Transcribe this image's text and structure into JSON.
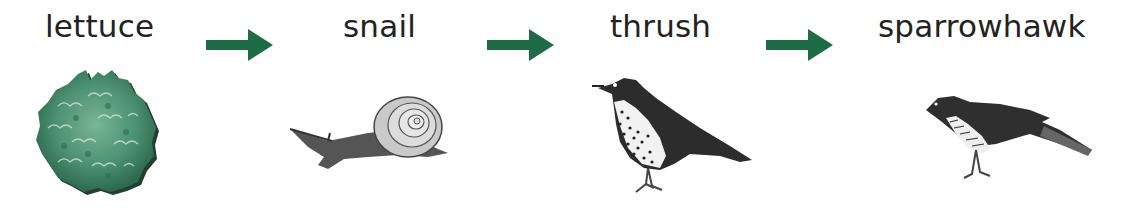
{
  "organisms": [
    {
      "label": "lettuce",
      "icon": "lettuce-icon"
    },
    {
      "label": "snail",
      "icon": "snail-icon"
    },
    {
      "label": "thrush",
      "icon": "thrush-icon"
    },
    {
      "label": "sparrowhawk",
      "icon": "sparrowhawk-icon"
    }
  ],
  "arrow_color": "#1f6b47",
  "arrows": [
    "lettuce→snail",
    "snail→thrush",
    "thrush→sparrowhawk"
  ]
}
